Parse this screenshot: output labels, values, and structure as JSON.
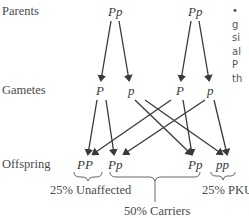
{
  "rows": {
    "parents": "Parents",
    "gametes": "Gametes",
    "offspring": "Offspring"
  },
  "parents": [
    "Pp",
    "Pp"
  ],
  "gametes": [
    "P",
    "p",
    "P",
    "p"
  ],
  "offspring": [
    "PP",
    "Pp",
    "Pp",
    "pp"
  ],
  "outcomes": {
    "unaffected": "25% Unaffected",
    "carriers": "50% Carriers",
    "pku": "25% PKU"
  },
  "side_text": [
    "•",
    "g",
    "si",
    "al",
    "P",
    "th"
  ]
}
